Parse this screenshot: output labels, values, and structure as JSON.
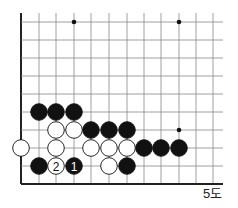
{
  "diagram": {
    "caption": "5도",
    "grid": {
      "xs": [
        21,
        39,
        56,
        74,
        91,
        109,
        127,
        144,
        161,
        179,
        196,
        213
      ],
      "ys": [
        22,
        40,
        58,
        76,
        94,
        112,
        130,
        148,
        166,
        184
      ],
      "right_end": 223,
      "top_start": 13
    },
    "star_points": [
      [
        3,
        0
      ],
      [
        9,
        0
      ],
      [
        9,
        6
      ]
    ],
    "stones": [
      {
        "col": 1,
        "row": 5,
        "color": "black"
      },
      {
        "col": 2,
        "row": 5,
        "color": "black"
      },
      {
        "col": 3,
        "row": 5,
        "color": "black"
      },
      {
        "col": 2,
        "row": 6,
        "color": "white"
      },
      {
        "col": 3,
        "row": 6,
        "color": "white"
      },
      {
        "col": 4,
        "row": 6,
        "color": "black"
      },
      {
        "col": 5,
        "row": 6,
        "color": "black"
      },
      {
        "col": 6,
        "row": 6,
        "color": "black"
      },
      {
        "col": 0,
        "row": 7,
        "color": "white"
      },
      {
        "col": 2,
        "row": 7,
        "color": "white"
      },
      {
        "col": 4,
        "row": 7,
        "color": "white"
      },
      {
        "col": 5,
        "row": 7,
        "color": "white"
      },
      {
        "col": 6,
        "row": 7,
        "color": "white"
      },
      {
        "col": 7,
        "row": 7,
        "color": "black"
      },
      {
        "col": 8,
        "row": 7,
        "color": "black"
      },
      {
        "col": 9,
        "row": 7,
        "color": "black"
      },
      {
        "col": 1,
        "row": 8,
        "color": "black"
      },
      {
        "col": 2,
        "row": 8,
        "color": "white",
        "label": "2"
      },
      {
        "col": 3,
        "row": 8,
        "color": "black",
        "label": "1"
      },
      {
        "col": 5,
        "row": 8,
        "color": "white"
      },
      {
        "col": 6,
        "row": 8,
        "color": "black"
      }
    ]
  }
}
